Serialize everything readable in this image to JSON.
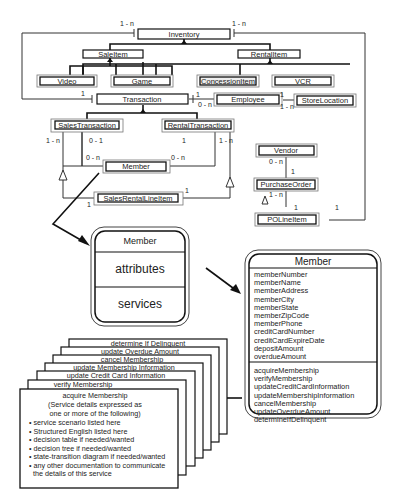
{
  "diagram": {
    "classes": {
      "inventory": "Inventory",
      "sale_item": "SaleItem",
      "rental_item": "RentalItem",
      "video": "Video",
      "game": "Game",
      "concession_item": "ConcessionItem",
      "vcr": "VCR",
      "transaction": "Transaction",
      "employee": "Employee",
      "store_location": "StoreLocation",
      "sales_transaction": "SalesTransaction",
      "rental_transaction": "RentalTransaction",
      "member": "Member",
      "sales_rental_line_item": "SalesRentalLineItem",
      "vendor": "Vendor",
      "purchase_order": "PurchaseOrder",
      "po_line_item": "POLineItem"
    },
    "multiplicities": {
      "inv_left": "1 - n",
      "inv_right": "1 - n",
      "trans_left": "1",
      "trans_emp_1": "1",
      "trans_emp_0n": "0 - n",
      "emp_store_1": "1",
      "emp_store_1n": "1 - n",
      "sales_1n": "1 - n",
      "sales_01": "0 - 1",
      "sales_0n": "0 - n",
      "rental_1": "1",
      "rental_0n": "0 - n",
      "rental_1n": "1 - n",
      "line_left_1": "1",
      "line_right_1": "1",
      "vendor_0n": "0 - n",
      "po_1": "1",
      "po_1n": "1 - n",
      "poline_1": "1",
      "poline_right_1": "1"
    },
    "generic_class": {
      "name": "Member",
      "attributes_label": "attributes",
      "services_label": "services"
    },
    "member_class": {
      "name": "Member",
      "attributes": [
        "memberNumber",
        "memberName",
        "memberAddress",
        "memberCity",
        "memberState",
        "memberZipCode",
        "memberPhone",
        "creditCardNumber",
        "creditCardExpireDate",
        "depositAmount",
        "overdueAmount"
      ],
      "services": [
        "acquireMembership",
        "verifyMembership",
        "updateCreditCardInformation",
        "updateMembershipInformation",
        "cancelMembership",
        "updateOverdueAmount",
        "determineIfDelinquent"
      ]
    },
    "service_cards": {
      "stack_titles": [
        "determine If Delinquent",
        "update Overdue Amount",
        "cancel Membership",
        "update Membership Information",
        "update Credit Card Information",
        "verify Membership"
      ],
      "front_title": "acquire Membership",
      "front_subtitle_1": "(Service details expressed as",
      "front_subtitle_2": "one or more of the following)",
      "bullets": [
        "• service scenario listed here",
        "• Structured English listed here",
        "• decision table if needed/wanted",
        "• decision tree if needed/wanted",
        "• state-transition diagram if needed/wanted",
        "• any other documentation to communicate",
        "  the details of this service"
      ]
    }
  }
}
